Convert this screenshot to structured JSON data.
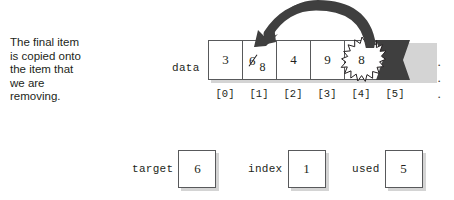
{
  "caption": {
    "text": "The final item\nis copied onto\nthe item that\nwe are\nremoving."
  },
  "array": {
    "label": "data",
    "ellipsis": "· · ·",
    "cells": [
      {
        "index_label": "[0]",
        "value": "3",
        "style": "plain"
      },
      {
        "index_label": "[1]",
        "old_value": "6",
        "value": "8",
        "style": "overwritten"
      },
      {
        "index_label": "[2]",
        "value": "4",
        "style": "plain"
      },
      {
        "index_label": "[3]",
        "value": "9",
        "style": "plain"
      },
      {
        "index_label": "[4]",
        "value": "8",
        "style": "burst"
      },
      {
        "index_label": "[5]",
        "value": "",
        "style": "filled"
      }
    ]
  },
  "arrow": {
    "name": "copy-arrow",
    "from_cell": "[4]",
    "to_cell": "[1]"
  },
  "variables": [
    {
      "name": "target",
      "value": "6"
    },
    {
      "name": "index",
      "value": "1"
    },
    {
      "name": "used",
      "value": "5"
    }
  ],
  "colors": {
    "ink": "#231f20",
    "outline": "#58595b",
    "shadow": "#d4d4d4",
    "fill_dark": "#3f3f3f",
    "background": "#ffffff"
  }
}
